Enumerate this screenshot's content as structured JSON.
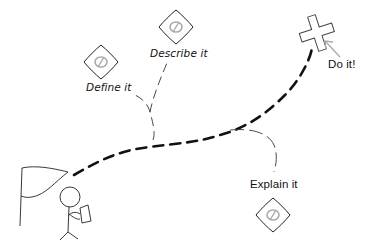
{
  "labels": {
    "define": "Define it",
    "describe": "Describe it",
    "do": "Do it!",
    "explain": "Explain it"
  },
  "icons": {
    "sign": "diamond-sign-with-null-symbol",
    "goal": "x-marks-the-spot-cross",
    "start": "flag",
    "person": "stick-figure-holding-map"
  },
  "colors": {
    "main_path": "#111111",
    "branch_path": "#333333",
    "sign_glyph": "#aaaaaa",
    "arrow": "#aaaaaa"
  }
}
